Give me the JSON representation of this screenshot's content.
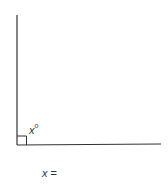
{
  "diagram": {
    "angle_label": {
      "variable": "x",
      "unit": "o"
    },
    "right_angle_marker": true,
    "answer_prompt": {
      "variable": "x",
      "equals": " ="
    },
    "colors": {
      "line": "#333333",
      "background": "#ffffff"
    }
  }
}
